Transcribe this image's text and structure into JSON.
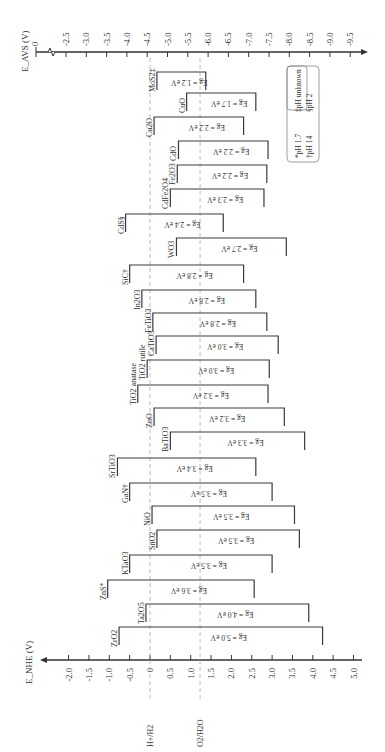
{
  "chart_data": {
    "type": "diagram",
    "orientation": "rotated 90 degrees counter-clockwise",
    "bottom_axis": {
      "label": "E_NHE (V)",
      "ticks": [
        "-2.0",
        "-1.5",
        "-1.0",
        "-0.5",
        "0",
        "0.5",
        "1.0",
        "1.5",
        "2.0",
        "2.5",
        "3.0",
        "3.5",
        "4.0",
        "4.5",
        "5.0"
      ],
      "range": [
        -2.0,
        5.0
      ]
    },
    "top_axis": {
      "label": "E_AVS (V)",
      "ticks": [
        "0",
        "-2.5",
        "-3.0",
        "-3.5",
        "-4.0",
        "-4.5",
        "-5.0",
        "-5.5",
        "-6.0",
        "-6.5",
        "-7.0",
        "-7.5",
        "-8.0",
        "-8.5",
        "-9.0",
        "-9.5"
      ],
      "has_break": true
    },
    "reference_lines": [
      {
        "label": "H+/H2",
        "value": 0.0
      },
      {
        "label": "O2/H2O",
        "value": 1.23
      }
    ],
    "materials": [
      {
        "name": "MoS2‡",
        "cb": 0.17,
        "vb": 1.37,
        "eg": "Eg = 1.2 eV",
        "y": 72
      },
      {
        "name": "CuO",
        "cb": 0.9,
        "vb": 2.6,
        "eg": "Eg = 1.7 eV",
        "y": 93
      },
      {
        "name": "Cu2O",
        "cb": 0.1,
        "vb": 2.3,
        "eg": "Eg = 2.2 eV",
        "y": 117
      },
      {
        "name": "CdO",
        "cb": 0.7,
        "vb": 2.9,
        "eg": "Eg = 2.2 eV",
        "y": 141
      },
      {
        "name": "Fe2O3",
        "cb": 0.67,
        "vb": 2.87,
        "eg": "Eg = 2.2 eV",
        "y": 165
      },
      {
        "name": "CdFe2O4",
        "cb": 0.5,
        "vb": 2.8,
        "eg": "Eg = 2.3 eV",
        "y": 189
      },
      {
        "name": "CdS§",
        "cb": -0.6,
        "vb": 1.8,
        "eg": "Eg = 2.4 eV",
        "y": 214
      },
      {
        "name": "WO3",
        "cb": 0.65,
        "vb": 3.35,
        "eg": "Eg = 2.7 eV",
        "y": 238
      },
      {
        "name": "SiC†",
        "cb": -0.5,
        "vb": 2.3,
        "eg": "Eg = 2.8 eV",
        "y": 265
      },
      {
        "name": "In2O3",
        "cb": -0.2,
        "vb": 2.6,
        "eg": "Eg = 2.8 eV",
        "y": 290
      },
      {
        "name": "FeTiO3",
        "cb": 0.07,
        "vb": 2.87,
        "eg": "Eg = 2.8 eV",
        "y": 313
      },
      {
        "name": "CaTiO3",
        "cb": 0.15,
        "vb": 3.15,
        "eg": "Eg = 3.0 eV",
        "y": 336
      },
      {
        "name": "TiO2 rutile",
        "cb": -0.07,
        "vb": 2.93,
        "eg": "Eg = 3.0 eV",
        "y": 360
      },
      {
        "name": "TiO2 anatase",
        "cb": -0.3,
        "vb": 2.9,
        "eg": "Eg = 3.2 eV",
        "y": 385
      },
      {
        "name": "ZnO",
        "cb": 0.1,
        "vb": 3.3,
        "eg": "Eg = 3.2 eV",
        "y": 408
      },
      {
        "name": "BaTiO3",
        "cb": 0.5,
        "vb": 3.8,
        "eg": "Eg = 3.3 eV",
        "y": 432
      },
      {
        "name": "SrTiO3",
        "cb": -0.8,
        "vb": 2.6,
        "eg": "Eg = 3.4 eV",
        "y": 458
      },
      {
        "name": "GaN†",
        "cb": -0.5,
        "vb": 3.0,
        "eg": "Eg = 3.5 eV",
        "y": 483
      },
      {
        "name": "NiO",
        "cb": 0.05,
        "vb": 3.55,
        "eg": "Eg = 3.5 eV",
        "y": 506
      },
      {
        "name": "SnO2",
        "cb": 0.17,
        "vb": 3.67,
        "eg": "Eg = 3.5 eV",
        "y": 530
      },
      {
        "name": "KTaO3",
        "cb": -0.5,
        "vb": 3.0,
        "eg": "Eg = 3.5 eV",
        "y": 555
      },
      {
        "name": "ZnS*",
        "cb": -1.04,
        "vb": 2.56,
        "eg": "Eg = 3.6 eV",
        "y": 580
      },
      {
        "name": "Ta2O5",
        "cb": -0.1,
        "vb": 3.9,
        "eg": "Eg = 4.0 eV",
        "y": 604
      },
      {
        "name": "ZrO2",
        "cb": -0.76,
        "vb": 4.24,
        "eg": "Eg = 5.0 eV",
        "y": 627
      }
    ],
    "legend": [
      {
        "symbol": "*",
        "text": "pH 1.7"
      },
      {
        "symbol": "†",
        "text": "pH 14"
      },
      {
        "symbol": "‡",
        "text": "pH unknown"
      },
      {
        "symbol": "§",
        "text": "pH 2"
      }
    ]
  }
}
